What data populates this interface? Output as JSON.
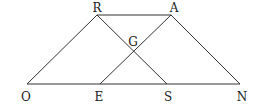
{
  "diagram": {
    "type": "geometry-figure",
    "line_color": "#333333",
    "label_color": "#222222",
    "points": {
      "R": {
        "label": "R",
        "x": 97,
        "y": 15,
        "lx": 97,
        "ly": 12
      },
      "A": {
        "label": "A",
        "x": 171,
        "y": 15,
        "lx": 174,
        "ly": 12
      },
      "G": {
        "label": "G",
        "x": 134,
        "y": 51,
        "lx": 133,
        "ly": 46
      },
      "O": {
        "label": "O",
        "x": 27,
        "y": 84,
        "lx": 26,
        "ly": 101
      },
      "E": {
        "label": "E",
        "x": 100,
        "y": 84,
        "lx": 99,
        "ly": 101
      },
      "S": {
        "label": "S",
        "x": 167,
        "y": 84,
        "lx": 168,
        "ly": 101
      },
      "N": {
        "label": "N",
        "x": 240,
        "y": 84,
        "lx": 242,
        "ly": 101
      }
    },
    "segments": [
      {
        "from": "R",
        "to": "A"
      },
      {
        "from": "O",
        "to": "N"
      },
      {
        "from": "O",
        "to": "R"
      },
      {
        "from": "A",
        "to": "N"
      },
      {
        "from": "R",
        "to": "S"
      },
      {
        "from": "E",
        "to": "A"
      }
    ]
  }
}
